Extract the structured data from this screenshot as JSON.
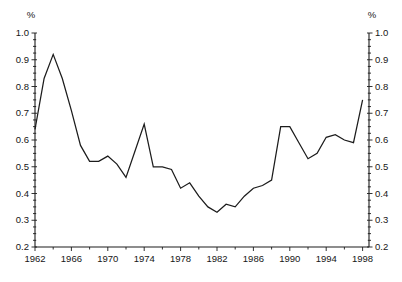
{
  "page": {
    "background": "#ffffff"
  },
  "chart_data": {
    "type": "line",
    "title": "",
    "xlabel": "",
    "ylabel": "",
    "y_unit_left": "%",
    "y_unit_right": "%",
    "x": [
      1962,
      1963,
      1964,
      1965,
      1966,
      1967,
      1968,
      1969,
      1970,
      1971,
      1972,
      1973,
      1974,
      1975,
      1976,
      1977,
      1978,
      1979,
      1980,
      1981,
      1982,
      1983,
      1984,
      1985,
      1986,
      1987,
      1988,
      1989,
      1990,
      1991,
      1992,
      1993,
      1994,
      1995,
      1996,
      1997,
      1998
    ],
    "series": [
      {
        "name": "share-percent",
        "values": [
          0.64,
          0.83,
          0.92,
          0.83,
          0.71,
          0.58,
          0.52,
          0.52,
          0.54,
          0.51,
          0.46,
          0.56,
          0.66,
          0.5,
          0.5,
          0.49,
          0.42,
          0.44,
          0.39,
          0.35,
          0.33,
          0.36,
          0.35,
          0.39,
          0.42,
          0.43,
          0.45,
          0.65,
          0.65,
          0.59,
          0.53,
          0.55,
          0.61,
          0.62,
          0.6,
          0.59,
          0.75
        ]
      }
    ],
    "xlim": [
      1962,
      1998.7
    ],
    "ylim": [
      0.2,
      1.0
    ],
    "y_major_ticks": [
      0.2,
      0.3,
      0.4,
      0.5,
      0.6,
      0.7,
      0.8,
      0.9,
      1.0
    ],
    "y_tick_labels": [
      "0.2",
      "0.3",
      "0.4",
      "0.5",
      "0.6",
      "0.7",
      "0.8",
      "0.9",
      "1.0"
    ],
    "y_minor_step": 0.025,
    "x_major_ticks": [
      1962,
      1966,
      1970,
      1974,
      1978,
      1982,
      1986,
      1990,
      1994,
      1998
    ],
    "x_tick_labels": [
      "1962",
      "1966",
      "1970",
      "1974",
      "1978",
      "1982",
      "1986",
      "1990",
      "1994",
      "1998"
    ],
    "x_minor_step": 2,
    "grid": false,
    "legend": "none",
    "line_color": "#1c1c1c",
    "axis_color": "#1c1c1c",
    "text_color": "#161616"
  }
}
